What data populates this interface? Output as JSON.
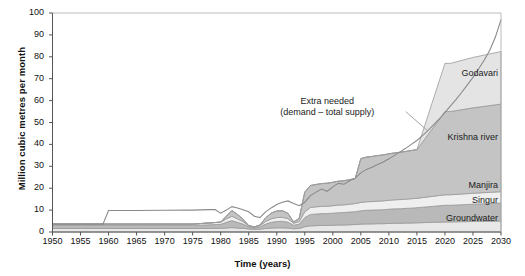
{
  "chart_data": {
    "type": "area",
    "title": "",
    "xlabel": "Time (years)",
    "ylabel": "Million cubic metres per month",
    "xlim": [
      1950,
      2030
    ],
    "ylim": [
      0,
      100
    ],
    "ytick_step": 10,
    "xtick_step": 5,
    "grid": false,
    "legend": "inline-labels-right",
    "stacked": true,
    "x": [
      1950,
      1955,
      1960,
      1965,
      1970,
      1975,
      1980,
      1981,
      1982,
      1983,
      1984,
      1985,
      1986,
      1987,
      1988,
      1989,
      1990,
      1991,
      1992,
      1993,
      1994,
      1995,
      1996,
      1997,
      1998,
      1999,
      2000,
      2001,
      2002,
      2003,
      2004,
      2005,
      2006,
      2007,
      2008,
      2009,
      2010,
      2011,
      2012,
      2013,
      2014,
      2015,
      2020,
      2021,
      2025,
      2030
    ],
    "yticks": [
      0,
      10,
      20,
      30,
      40,
      50,
      60,
      70,
      80,
      90,
      100
    ],
    "xticks": [
      1950,
      1955,
      1960,
      1965,
      1970,
      1975,
      1980,
      1985,
      1990,
      1995,
      2000,
      2005,
      2010,
      2015,
      2020,
      2025,
      2030
    ],
    "series": [
      {
        "name": "Groundwater",
        "color": "#e8e8e8",
        "values": [
          1.6,
          1.6,
          1.6,
          1.6,
          1.6,
          1.6,
          1.7,
          1.8,
          2.0,
          1.8,
          1.7,
          1.4,
          1.2,
          1.3,
          1.6,
          1.8,
          1.9,
          1.9,
          1.8,
          1.5,
          1.6,
          2.4,
          2.8,
          2.9,
          3.0,
          3.0,
          3.1,
          3.2,
          3.2,
          3.3,
          3.4,
          3.6,
          3.7,
          3.7,
          3.8,
          3.8,
          3.9,
          4.0,
          4.0,
          4.1,
          4.1,
          4.2,
          4.6,
          4.6,
          4.8,
          5.0
        ]
      },
      {
        "name": "Singur",
        "color": "#b9b9b9",
        "values": [
          1.4,
          1.4,
          1.4,
          1.4,
          1.4,
          1.4,
          1.8,
          2.6,
          3.2,
          2.6,
          1.9,
          1.0,
          0.7,
          1.0,
          2.0,
          2.6,
          2.9,
          3.0,
          2.7,
          1.6,
          2.0,
          4.2,
          5.2,
          5.3,
          5.4,
          5.4,
          5.5,
          5.6,
          5.7,
          5.8,
          5.9,
          6.1,
          6.2,
          6.3,
          6.3,
          6.4,
          6.5,
          6.6,
          6.6,
          6.7,
          6.8,
          6.9,
          7.6,
          7.6,
          7.9,
          8.2
        ]
      },
      {
        "name": "Manjira",
        "color": "#efefef",
        "values": [
          0.6,
          0.6,
          0.6,
          0.6,
          0.6,
          0.6,
          1.0,
          1.6,
          2.0,
          1.6,
          1.1,
          0.5,
          0.4,
          0.6,
          1.2,
          1.6,
          1.8,
          1.8,
          1.6,
          0.9,
          1.2,
          2.6,
          3.2,
          3.3,
          3.3,
          3.4,
          3.4,
          3.5,
          3.5,
          3.6,
          3.7,
          3.8,
          3.9,
          3.9,
          4.0,
          4.0,
          4.1,
          4.1,
          4.2,
          4.2,
          4.3,
          4.3,
          4.8,
          4.8,
          5.0,
          5.2
        ]
      },
      {
        "name": "Krishna river",
        "color": "#c4c4c4",
        "values": [
          0,
          0,
          0,
          0,
          0,
          0,
          0,
          1.2,
          2.6,
          2.0,
          1.1,
          0,
          0,
          0.3,
          1.6,
          2.6,
          3.0,
          3.0,
          2.4,
          0.6,
          1.4,
          9.0,
          10.0,
          10.2,
          10.4,
          10.5,
          10.7,
          10.9,
          11.0,
          11.2,
          11.4,
          20.0,
          20.4,
          20.6,
          20.8,
          21.0,
          21.2,
          21.4,
          21.6,
          21.8,
          22.0,
          22.2,
          38.0,
          38.0,
          39.0,
          40.0
        ]
      },
      {
        "name": "Godavari",
        "color": "#e4e4e4",
        "values": [
          0,
          0,
          0,
          0,
          0,
          0,
          0,
          0,
          0,
          0,
          0,
          0,
          0,
          0,
          0,
          0,
          0,
          0,
          0,
          0,
          0,
          0,
          0,
          0,
          0,
          0,
          0,
          0,
          0,
          0,
          0,
          0,
          0,
          0,
          0,
          0,
          0,
          0,
          0,
          0,
          0,
          0,
          22.0,
          22.0,
          23.0,
          24.0
        ]
      },
      {
        "name": "Total supply (upper envelope)",
        "color": "#ffffff",
        "note": "top of stacked supply bands"
      }
    ],
    "extra_needed_line": {
      "label": "Extra needed\n(demand – total supply)",
      "label_line1": "Extra needed",
      "label_line2": "(demand – total supply)",
      "color": "#8a8a8a",
      "x": [
        1950,
        1955,
        1959,
        1960,
        1965,
        1970,
        1975,
        1978,
        1979,
        1980,
        1981,
        1982,
        1983,
        1984,
        1985,
        1986,
        1987,
        1988,
        1989,
        1990,
        1991,
        1992,
        1993,
        1994,
        1995,
        1996,
        1997,
        1998,
        1999,
        2000,
        2001,
        2002,
        2003,
        2004,
        2005,
        2006,
        2007,
        2008,
        2009,
        2010,
        2011,
        2012,
        2013,
        2014,
        2015,
        2016,
        2017,
        2018,
        2019,
        2020,
        2021,
        2022,
        2023,
        2024,
        2025,
        2026,
        2027,
        2028,
        2029,
        2030
      ],
      "y": [
        3.6,
        3.6,
        3.6,
        9.8,
        9.8,
        9.9,
        10.0,
        10.2,
        10.3,
        8.6,
        10.0,
        11.6,
        11.0,
        10.2,
        9.2,
        7.2,
        6.6,
        9.2,
        11.0,
        12.6,
        13.6,
        14.2,
        13.0,
        12.0,
        13.6,
        16.6,
        18.2,
        19.6,
        18.6,
        20.6,
        22.2,
        21.8,
        23.4,
        24.6,
        27.0,
        28.6,
        29.6,
        30.8,
        32.0,
        33.4,
        35.0,
        36.6,
        38.2,
        40.0,
        41.8,
        44.0,
        46.4,
        49.0,
        51.6,
        54.6,
        57.6,
        60.6,
        63.8,
        67.2,
        70.6,
        74.4,
        78.4,
        83.0,
        89.0,
        97.0
      ]
    },
    "band_labels": [
      {
        "name": "Godavari",
        "x": 2024,
        "y": 72
      },
      {
        "name": "Krishna river",
        "x": 2024,
        "y": 43
      },
      {
        "name": "Manjira",
        "x": 2028,
        "y": 21
      },
      {
        "name": "Singur",
        "x": 2028,
        "y": 14
      },
      {
        "name": "Groundwater",
        "x": 2026,
        "y": 6
      }
    ]
  }
}
